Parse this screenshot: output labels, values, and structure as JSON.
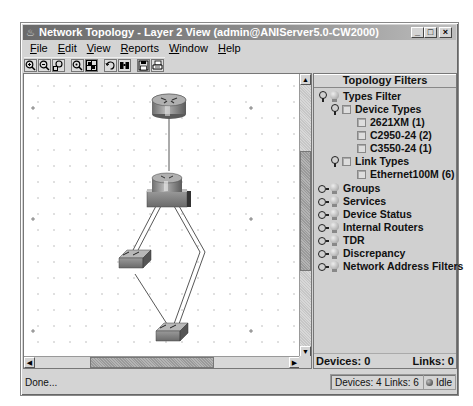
{
  "window": {
    "title": "Network Topology - Layer 2 View (admin@ANIServer5.0-CW2000)",
    "controls": {
      "minimize": "_",
      "maximize": "□",
      "close": "×"
    }
  },
  "menu": [
    {
      "label": "File",
      "mnemonic": "F"
    },
    {
      "label": "Edit",
      "mnemonic": "E"
    },
    {
      "label": "View",
      "mnemonic": "V"
    },
    {
      "label": "Reports",
      "mnemonic": "R"
    },
    {
      "label": "Window",
      "mnemonic": "W"
    },
    {
      "label": "Help",
      "mnemonic": "H"
    }
  ],
  "toolbar": [
    {
      "icon": "zoom-in-icon"
    },
    {
      "icon": "zoom-out-icon"
    },
    {
      "icon": "zoom-region-icon"
    },
    {
      "icon": "zoom-fit-icon"
    },
    {
      "icon": "layout-grid-icon"
    },
    {
      "icon": "refresh-icon"
    },
    {
      "icon": "find-binoculars-icon"
    },
    {
      "icon": "save-icon"
    },
    {
      "icon": "print-icon"
    }
  ],
  "topology": {
    "devices": [
      {
        "id": "router",
        "type": "router",
        "x": 142,
        "y": 30
      },
      {
        "id": "layer3-switch",
        "type": "router-switch",
        "x": 142,
        "y": 114
      },
      {
        "id": "switch-left",
        "type": "switch",
        "x": 112,
        "y": 186
      },
      {
        "id": "switch-bottom",
        "type": "switch",
        "x": 146,
        "y": 260
      }
    ],
    "link_count": 6
  },
  "filters": {
    "header": "Topology Filters",
    "types_filter": "Types Filter",
    "device_types": "Device Types",
    "device_items": [
      "2621XM (1)",
      "C2950-24 (2)",
      "C3550-24 (1)"
    ],
    "link_types": "Link Types",
    "link_items": [
      "Ethernet100M (6)"
    ],
    "collapsed": [
      "Groups",
      "Services",
      "Device Status",
      "Internal Routers",
      "TDR",
      "Discrepancy",
      "Network Address Filters"
    ],
    "footer": {
      "devices": "Devices: 0",
      "links": "Links: 0"
    }
  },
  "status": {
    "message": "Done...",
    "counts": "Devices: 4 Links: 6",
    "state": "Idle"
  }
}
